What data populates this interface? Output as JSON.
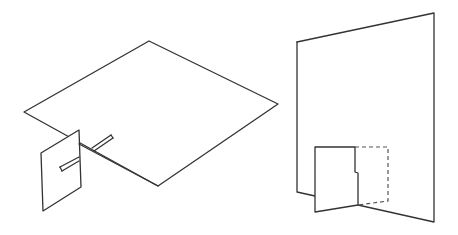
{
  "figure": {
    "left_model": {
      "description": "Flat rhombus sheet with a small vertical card slotted into its left-lower edge, with slot rods",
      "sheet_vertices": [
        [
          149,
          41
        ],
        [
          278,
          104
        ],
        [
          158,
          186
        ],
        [
          24,
          112
        ]
      ],
      "card_vertices": [
        [
          41,
          153
        ],
        [
          79,
          130
        ],
        [
          81,
          187
        ],
        [
          43,
          211
        ]
      ],
      "card_rod": [
        [
          61,
          169
        ],
        [
          79,
          159
        ]
      ],
      "sheet_rod": [
        [
          93,
          150
        ],
        [
          112,
          137
        ]
      ]
    },
    "right_model": {
      "description": "Large vertical panel with a small folded card at its base; dashed outline shows the card's unfolded position",
      "panel_vertices": [
        [
          297,
          42
        ],
        [
          434,
          13
        ],
        [
          434,
          222
        ],
        [
          358,
          205
        ],
        [
          315,
          196
        ],
        [
          297,
          192
        ]
      ],
      "card_vertices": [
        [
          315,
          147
        ],
        [
          355,
          147
        ],
        [
          355,
          172
        ],
        [
          358,
          173
        ],
        [
          358,
          205
        ],
        [
          315,
          212
        ]
      ],
      "dashed_outline": [
        [
          355,
          147
        ],
        [
          388,
          147
        ],
        [
          388,
          201
        ],
        [
          358,
          205
        ]
      ]
    },
    "stroke_color": "#333333",
    "background_color": "#ffffff"
  }
}
